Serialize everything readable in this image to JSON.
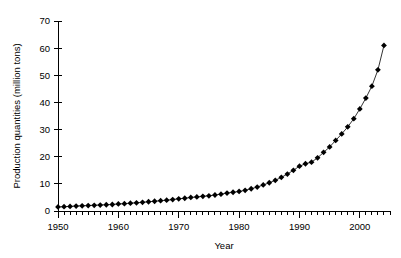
{
  "chart_data": {
    "type": "line",
    "title": "",
    "xlabel": "Year",
    "ylabel": "Production quantities (million tons)",
    "xlim": [
      1950,
      2005
    ],
    "ylim": [
      0,
      70
    ],
    "grid": false,
    "legend": false,
    "marker": "diamond",
    "marker_color": "#000000",
    "line_color": "#000000",
    "x_ticks_major": [
      1950,
      1960,
      1970,
      1980,
      1990,
      2000
    ],
    "x_tick_labels": [
      "1950",
      "1960",
      "1970",
      "1980",
      "1990",
      "2000"
    ],
    "x_minor_tick_interval": 1,
    "y_ticks": [
      0,
      10,
      20,
      30,
      40,
      50,
      60,
      70
    ],
    "y_tick_labels": [
      "0",
      "10",
      "20",
      "30",
      "40",
      "50",
      "60",
      "70"
    ],
    "x": [
      1950,
      1951,
      1952,
      1953,
      1954,
      1955,
      1956,
      1957,
      1958,
      1959,
      1960,
      1961,
      1962,
      1963,
      1964,
      1965,
      1966,
      1967,
      1968,
      1969,
      1970,
      1971,
      1972,
      1973,
      1974,
      1975,
      1976,
      1977,
      1978,
      1979,
      1980,
      1981,
      1982,
      1983,
      1984,
      1985,
      1986,
      1987,
      1988,
      1989,
      1990,
      1991,
      1992,
      1993,
      1994,
      1995,
      1996,
      1997,
      1998,
      1999,
      2000,
      2001,
      2002,
      2003,
      2004
    ],
    "values": [
      1.5,
      1.6,
      1.7,
      1.8,
      1.9,
      2.0,
      2.1,
      2.2,
      2.3,
      2.4,
      2.6,
      2.7,
      2.9,
      3.0,
      3.2,
      3.4,
      3.6,
      3.8,
      4.0,
      4.2,
      4.5,
      4.7,
      5.0,
      5.2,
      5.4,
      5.6,
      5.9,
      6.2,
      6.6,
      6.9,
      7.2,
      7.6,
      8.2,
      8.8,
      9.6,
      10.4,
      11.3,
      12.4,
      13.6,
      15.0,
      16.5,
      17.4,
      18.0,
      19.6,
      21.6,
      23.6,
      26.0,
      28.4,
      31.0,
      34.0,
      37.6,
      41.6,
      46.0,
      52.0,
      61.0
    ],
    "series_name": "Production quantities"
  },
  "axes": {
    "y_axis_title": "Production quantities (million tons)",
    "x_axis_title": "Year"
  }
}
